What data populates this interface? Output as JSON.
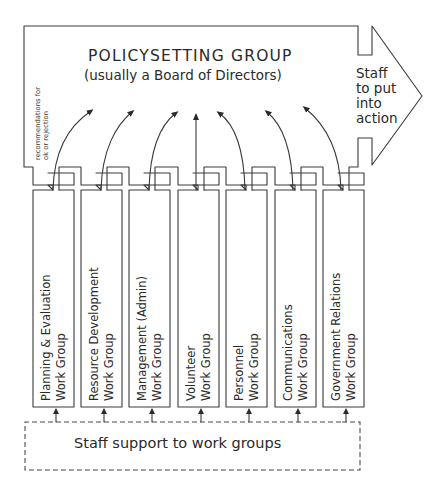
{
  "policy_group": {
    "title": "POLICYSETTING GROUP",
    "subtitle": "(usually a Board of Directors)",
    "side_note_line1": "recommendations for",
    "side_note_line2": "ok or rejection"
  },
  "action_arrow": {
    "line1": "Staff",
    "line2": "to put",
    "line3": "into",
    "line4": "action"
  },
  "work_groups": [
    {
      "line1": "Planning & Evaluation",
      "line2": "Work Group"
    },
    {
      "line1": "Resource Development",
      "line2": "Work Group"
    },
    {
      "line1": "Management (Admin)",
      "line2": "Work Group"
    },
    {
      "line1": "Volunteer",
      "line2": "Work Group"
    },
    {
      "line1": "Personnel",
      "line2": "Work Group"
    },
    {
      "line1": "Communications",
      "line2": "Work Group"
    },
    {
      "line1": "Government Relations",
      "line2": "Work Group"
    }
  ],
  "staff_support": {
    "label": "Staff support to work groups"
  },
  "colors": {
    "line": "#3a3a3a",
    "text": "#2a2a2a",
    "background": "#ffffff"
  }
}
